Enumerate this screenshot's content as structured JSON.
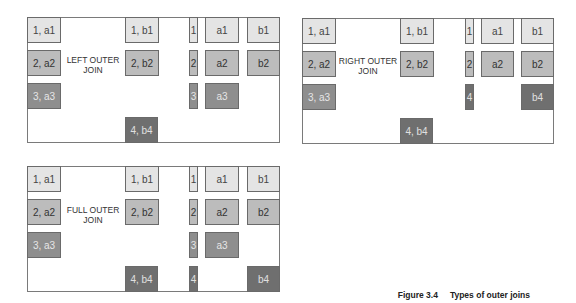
{
  "colors": {
    "shade1": "#e4e4e4",
    "shade2": "#bcbcbc",
    "shade3": "#8e8e8e",
    "shade4": "#6f6f6f",
    "border": "#7a7a7a"
  },
  "panels": [
    {
      "title_line1": "LEFT OUTER",
      "title_line2": "JOIN",
      "left_table": [
        "1, a1",
        "2, a2",
        "3, a3"
      ],
      "right_table": [
        "1, b1",
        "2, b2",
        "4, b4"
      ],
      "result": {
        "keys": [
          "1",
          "2",
          "3"
        ],
        "a": [
          "a1",
          "a2",
          "a3"
        ],
        "b": [
          "b1",
          "b2"
        ]
      }
    },
    {
      "title_line1": "RIGHT OUTER",
      "title_line2": "JOIN",
      "left_table": [
        "1, a1",
        "2, a2",
        "3, a3"
      ],
      "right_table": [
        "1, b1",
        "2, b2",
        "4, b4"
      ],
      "result": {
        "keys": [
          "1",
          "2",
          "4"
        ],
        "a": [
          "a1",
          "a2"
        ],
        "b": [
          "b1",
          "b2",
          "b4"
        ]
      }
    },
    {
      "title_line1": "FULL OUTER",
      "title_line2": "JOIN",
      "left_table": [
        "1, a1",
        "2, a2",
        "3, a3"
      ],
      "right_table": [
        "1, b1",
        "2, b2",
        "4, b4"
      ],
      "result": {
        "keys": [
          "1",
          "2",
          "3",
          "4"
        ],
        "a": [
          "a1",
          "a2",
          "a3"
        ],
        "b": [
          "b1",
          "b2",
          "b4"
        ]
      }
    }
  ],
  "caption": {
    "figure": "Figure 3.4",
    "text": "Types of outer joins"
  }
}
